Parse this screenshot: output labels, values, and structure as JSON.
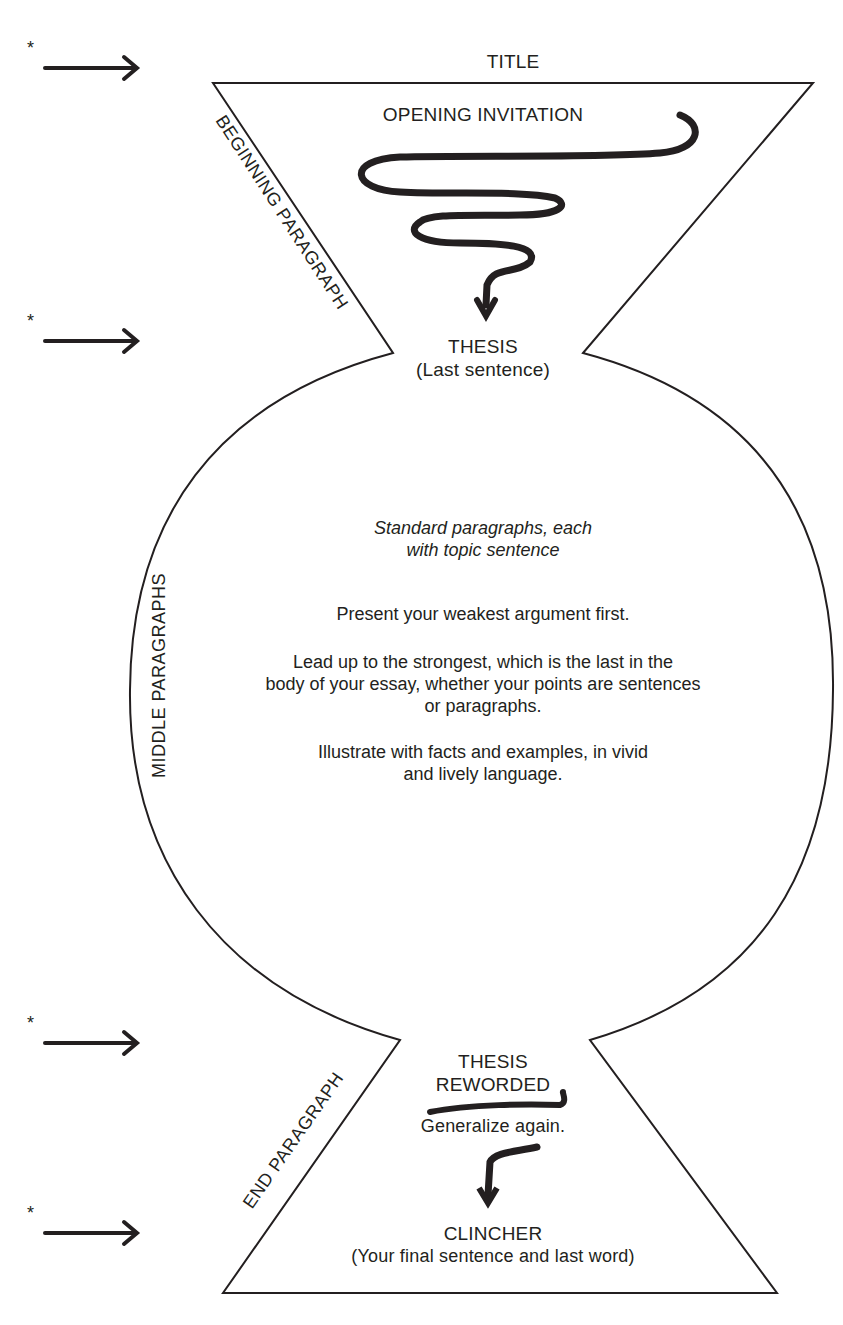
{
  "diagram": {
    "title": "TITLE",
    "beginning": {
      "side_label": "BEGINNING PARAGRAPH",
      "opening": "OPENING INVITATION",
      "thesis": "THESIS",
      "thesis_note": "(Last sentence)"
    },
    "middle": {
      "side_label": "MIDDLE PARAGRAPHS",
      "lines": [
        {
          "text": "Standard paragraphs, each\nwith topic sentence",
          "style": "italic"
        },
        {
          "text": "Present your weakest argument first.",
          "style": "normal"
        },
        {
          "text": "Lead up to the strongest, which is the last in the\nbody of your essay, whether your points are sentences\nor paragraphs.",
          "style": "normal"
        },
        {
          "text": "Illustrate with facts and examples, in vivid\nand lively language.",
          "style": "normal"
        }
      ]
    },
    "end": {
      "side_label": "END PARAGRAPH",
      "thesis_reworded_1": "THESIS",
      "thesis_reworded_2": "REWORDED",
      "generalize": "Generalize again.",
      "clincher": "CLINCHER",
      "clincher_note": "(Your final sentence and last word)"
    },
    "markers": [
      {
        "symbol": "*",
        "icon": "arrow-right-icon"
      },
      {
        "symbol": "*",
        "icon": "arrow-right-icon"
      },
      {
        "symbol": "*",
        "icon": "arrow-right-icon"
      },
      {
        "symbol": "*",
        "icon": "arrow-right-icon"
      }
    ],
    "colors": {
      "ink": "#231f20",
      "background": "#ffffff"
    }
  }
}
